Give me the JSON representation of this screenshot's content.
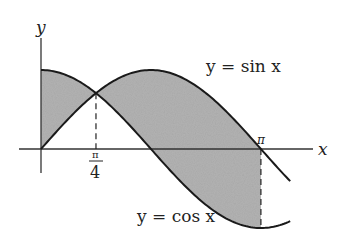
{
  "figure": {
    "type": "area-between-curves",
    "axes": {
      "x_label": "x",
      "y_label": "y",
      "origin_px": [
        41,
        149
      ],
      "px_per_unit_x": 70,
      "px_per_unit_y": 79
    },
    "curves": [
      {
        "name": "sine",
        "label": "y = sin x",
        "fn": "sin",
        "x_range": [
          0,
          3.56
        ]
      },
      {
        "name": "cosine",
        "label": "y = cos x",
        "fn": "cos",
        "x_range": [
          0,
          3.56
        ]
      }
    ],
    "shaded_region": {
      "from": 0,
      "to": 3.14159,
      "between": [
        "sin",
        "cos"
      ],
      "color": "#b3b3b3"
    },
    "ticks": [
      {
        "value": 0.785398,
        "label_num": "π",
        "label_den": "4"
      },
      {
        "value": 3.14159,
        "label": "π"
      }
    ],
    "dashed_lines": [
      0.785398,
      3.14159
    ],
    "colors": {
      "curve": "#1a1a1a",
      "axis": "#333333",
      "fill": "#b3b3b3"
    }
  }
}
